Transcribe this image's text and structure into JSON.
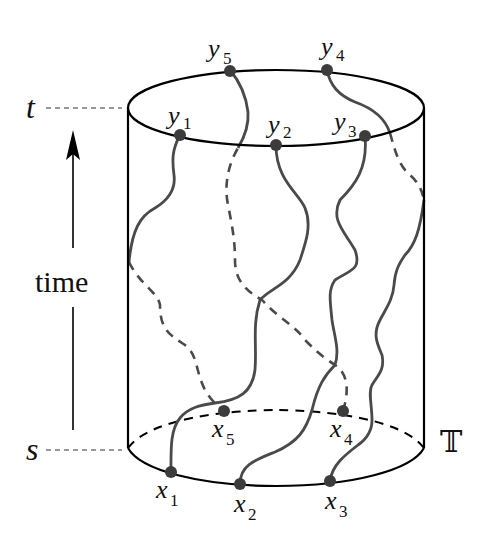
{
  "figure": {
    "type": "cylinder-space-time-diagram",
    "axis": {
      "top_label": "t",
      "bottom_label": "s",
      "arrow_label": "time",
      "space_label": "𝕋"
    },
    "top_points": [
      {
        "name": "y",
        "index": "1"
      },
      {
        "name": "y",
        "index": "2"
      },
      {
        "name": "y",
        "index": "3"
      },
      {
        "name": "y",
        "index": "4"
      },
      {
        "name": "y",
        "index": "5"
      }
    ],
    "bottom_points": [
      {
        "name": "x",
        "index": "1"
      },
      {
        "name": "x",
        "index": "2"
      },
      {
        "name": "x",
        "index": "3"
      },
      {
        "name": "x",
        "index": "4"
      },
      {
        "name": "x",
        "index": "5"
      }
    ],
    "paths": [
      {
        "from": "x1",
        "to": "y2",
        "visibility": "front"
      },
      {
        "from": "x2",
        "to": "y3",
        "visibility": "front"
      },
      {
        "from": "x3",
        "to": "y4",
        "visibility": "front-then-back"
      },
      {
        "from": "x4",
        "to": "y5",
        "visibility": "back-then-front"
      },
      {
        "from": "x5",
        "to": "y1",
        "visibility": "back-then-front"
      }
    ],
    "colors": {
      "outline": "#000000",
      "path": "#4a4a4a",
      "point": "#3c3c3c",
      "guide": "#333333"
    }
  }
}
